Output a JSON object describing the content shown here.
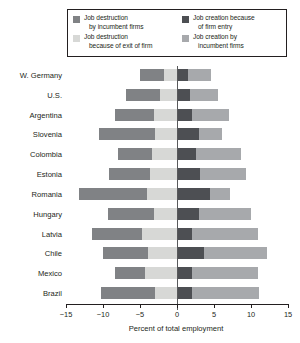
{
  "legend": {
    "items": [
      {
        "label_line1": "Job destruction",
        "label_line2": "by incumbent firms",
        "color": "#808285",
        "name": "job-destruction-incumbent"
      },
      {
        "label_line1": "Job creation because",
        "label_line2": "of firm entry",
        "color": "#4d4f53",
        "name": "job-creation-entry"
      },
      {
        "label_line1": "Job destruction",
        "label_line2": "because of exit of firm",
        "color": "#d7d8d6",
        "name": "job-destruction-exit"
      },
      {
        "label_line1": "Job creation by",
        "label_line2": "incumbent firms",
        "color": "#a7a9ac",
        "name": "job-creation-incumbent"
      }
    ]
  },
  "axis": {
    "xlabel": "Percent of total employment",
    "ticks": [
      "−15",
      "−10",
      "−5",
      "0",
      "5",
      "10",
      "15"
    ],
    "tick_values": [
      -15,
      -10,
      -5,
      0,
      5,
      10,
      15
    ],
    "xlim": [
      -15,
      15
    ]
  },
  "chart_data": {
    "type": "bar",
    "orientation": "horizontal",
    "stacked": true,
    "diverging": true,
    "title": "",
    "xlabel": "Percent of total employment",
    "ylabel": "",
    "xlim": [
      -15,
      15
    ],
    "grid": false,
    "legend_position": "top",
    "categories": [
      "W. Germany",
      "U.S.",
      "Argentina",
      "Slovenia",
      "Colombia",
      "Estonia",
      "Romania",
      "Hungary",
      "Latvia",
      "Chile",
      "Mexico",
      "Brazil"
    ],
    "series": [
      {
        "name": "Job destruction by incumbent firms",
        "color": "#808285",
        "side": "negative",
        "values": [
          -3.2,
          -4.6,
          -5.3,
          -7.5,
          -4.6,
          -5.6,
          -9.2,
          -6.2,
          -6.8,
          -6.1,
          -4.1,
          -7.3
        ]
      },
      {
        "name": "Job destruction because of exit of firm",
        "color": "#d7d8d6",
        "side": "negative",
        "values": [
          -1.8,
          -2.3,
          -3.1,
          -3.0,
          -3.4,
          -3.6,
          -4.0,
          -3.1,
          -4.7,
          -3.9,
          -4.3,
          -3.0
        ]
      },
      {
        "name": "Job creation because of firm entry",
        "color": "#4d4f53",
        "side": "positive",
        "values": [
          1.5,
          1.7,
          2.0,
          3.0,
          2.6,
          3.1,
          4.5,
          3.0,
          2.0,
          3.6,
          2.0,
          2.0
        ]
      },
      {
        "name": "Job creation by incumbent firms",
        "color": "#a7a9ac",
        "side": "positive",
        "values": [
          3.1,
          3.8,
          5.0,
          3.1,
          6.0,
          6.2,
          2.7,
          7.0,
          9.0,
          8.5,
          9.0,
          9.1
        ]
      }
    ]
  }
}
